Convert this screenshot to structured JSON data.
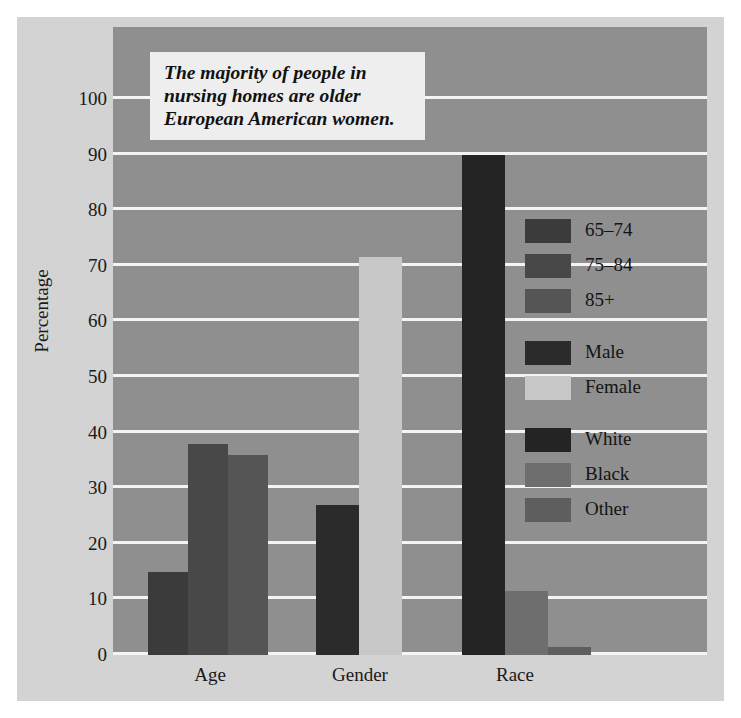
{
  "callout": {
    "text": "The majority of people in\nnursing homes are older\nEuropean American women."
  },
  "axes": {
    "ylabel": "Percentage",
    "yticks": [
      "100",
      "90",
      "80",
      "70",
      "60",
      "50",
      "40",
      "30",
      "20",
      "10",
      "0"
    ],
    "xticks": [
      "Age",
      "Gender",
      "Race"
    ]
  },
  "legend": [
    {
      "label": "65–74",
      "color": "#3b3b3b"
    },
    {
      "label": "75–84",
      "color": "#484848"
    },
    {
      "label": "85+",
      "color": "#555555"
    },
    {
      "label": "Male",
      "color": "#2b2b2b"
    },
    {
      "label": "Female",
      "color": "#c8c8c8"
    },
    {
      "label": "White",
      "color": "#242424"
    },
    {
      "label": "Black",
      "color": "#6e6e6e"
    },
    {
      "label": "Other",
      "color": "#5e5e5e"
    }
  ],
  "chart_data": {
    "type": "bar",
    "title": "",
    "xlabel": "",
    "ylabel": "Percentage",
    "ylim": [
      0,
      100
    ],
    "ytick_step": 10,
    "grid": true,
    "legend_position": "right",
    "categories": [
      "Age",
      "Gender",
      "Race"
    ],
    "bars": [
      {
        "group": "Age",
        "label": "65–74",
        "value": 15,
        "color": "#3b3b3b"
      },
      {
        "group": "Age",
        "label": "75–84",
        "value": 38,
        "color": "#484848"
      },
      {
        "group": "Age",
        "label": "85+",
        "value": 36,
        "color": "#555555"
      },
      {
        "group": "Gender",
        "label": "Male",
        "value": 27,
        "color": "#2b2b2b"
      },
      {
        "group": "Gender",
        "label": "Female",
        "value": 71.5,
        "color": "#c8c8c8"
      },
      {
        "group": "Race",
        "label": "White",
        "value": 90,
        "color": "#242424"
      },
      {
        "group": "Race",
        "label": "Black",
        "value": 11.5,
        "color": "#6e6e6e"
      },
      {
        "group": "Race",
        "label": "Other",
        "value": 1.5,
        "color": "#5e5e5e"
      }
    ]
  },
  "geometry": {
    "bar_x": [
      148,
      188,
      228,
      316,
      359,
      462,
      505,
      548
    ],
    "bar_w": [
      40,
      40,
      40,
      43,
      43,
      43,
      43,
      43
    ],
    "xtick_x": [
      150,
      300,
      455
    ],
    "xtick_w": [
      120,
      120,
      120
    ]
  },
  "colors": {
    "paper": "#d3d3d3",
    "plot_background": "#8f8f8f",
    "gridline": "#f4f4f4",
    "callout_background": "#eeeeee",
    "text": "#1a1a1a"
  }
}
